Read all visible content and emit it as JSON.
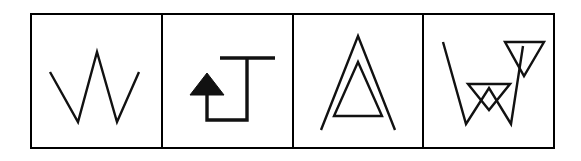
{
  "canvas": {
    "width": 581,
    "height": 161,
    "background_color": "#ffffff",
    "ink_color": "#111111",
    "frame_color": "#000000"
  },
  "frame": {
    "name": "four-panel-strip",
    "x": 31,
    "y": 14,
    "width": 523,
    "height": 134,
    "stroke_width": 2,
    "panel_count": 4,
    "divider_x_positions": [
      162,
      293,
      423
    ]
  },
  "panels": [
    {
      "index": 1,
      "label": "panel-1",
      "figure_name": "zigzag-w-stroke",
      "description": "Open W-shaped zigzag polyline, five vertices, uniform thin stroke",
      "bounds": {
        "x": 31,
        "y": 14,
        "width": 131,
        "height": 134
      },
      "stroke_width": 2.4,
      "filled": false,
      "paths": [
        {
          "name": "w-polyline",
          "type": "polyline",
          "points": "50,72 78,122 97,52 117,122 139,72"
        }
      ]
    },
    {
      "index": 2,
      "label": "panel-2",
      "figure_name": "arrow-hook-j",
      "description": "Hook or J shaped path with horizontal top bar, right vertical stem, bottom horizontal return and a left vertical riser terminating in a solid upward arrowhead",
      "bounds": {
        "x": 162,
        "y": 14,
        "width": 131,
        "height": 134
      },
      "stroke_width": 3.4,
      "filled": false,
      "paths": [
        {
          "name": "top-bar",
          "type": "polyline",
          "points": "220,58 275,58"
        },
        {
          "name": "hook-stem-and-return",
          "type": "polyline",
          "points": "247,58 247,120 207,120 207,92"
        }
      ],
      "arrowhead": {
        "name": "up-arrowhead",
        "type": "filled-triangle",
        "points": "207,73 190,95 224,95",
        "fill_color": "#111111"
      }
    },
    {
      "index": 3,
      "label": "panel-3",
      "figure_name": "nested-triangles",
      "description": "Outer open inverted-V whose legs extend below, containing a smaller closed triangle",
      "bounds": {
        "x": 293,
        "y": 14,
        "width": 130,
        "height": 134
      },
      "stroke_width": 2.4,
      "filled": false,
      "paths": [
        {
          "name": "outer-open-chevron",
          "type": "polyline",
          "points": "321,130 358,36 395,130"
        },
        {
          "name": "inner-closed-triangle",
          "type": "polygon",
          "points": "358,62 382,116 334,116"
        }
      ]
    },
    {
      "index": 4,
      "label": "panel-4",
      "figure_name": "w-with-overlaid-triangles",
      "description": "Large open W polyline overlaid by two downward pointing outline triangles, one small at center and one larger at upper right",
      "bounds": {
        "x": 423,
        "y": 14,
        "width": 131,
        "height": 134
      },
      "stroke_width": 2.4,
      "filled": false,
      "paths": [
        {
          "name": "w-polyline",
          "type": "polyline",
          "points": "443,42 466,124 489,88 511,124 523,46"
        },
        {
          "name": "center-down-triangle",
          "type": "polygon",
          "points": "468,84 510,84 489,110"
        },
        {
          "name": "upper-right-down-triangle",
          "type": "polygon",
          "points": "505,42 544,42 524,76"
        }
      ]
    }
  ]
}
